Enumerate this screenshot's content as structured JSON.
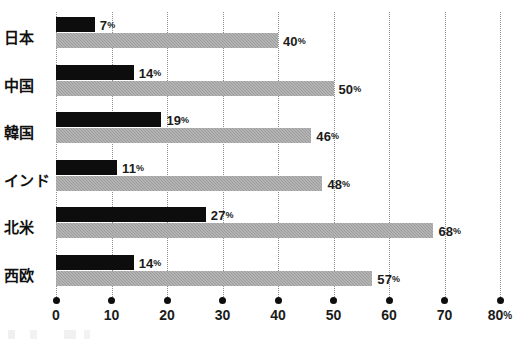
{
  "chart_data": {
    "type": "bar",
    "orientation": "horizontal",
    "title": "",
    "subtitle": "",
    "xlabel": "",
    "ylabel": "",
    "categories": [
      "日本",
      "中国",
      "韓国",
      "インド",
      "北米",
      "西欧"
    ],
    "series": [
      {
        "name": "dark-series",
        "color": "#0d0d0d",
        "values": [
          7,
          14,
          19,
          11,
          27,
          14
        ],
        "labels": [
          "7%",
          "14%",
          "19%",
          "11%",
          "27%",
          "14%"
        ]
      },
      {
        "name": "light-series",
        "color": "#9d9d9d",
        "values": [
          40,
          50,
          46,
          48,
          68,
          57
        ],
        "labels": [
          "40%",
          "50%",
          "46%",
          "48%",
          "68%",
          "57%"
        ]
      }
    ],
    "xlim": [
      0,
      80
    ],
    "xticks": [
      0,
      10,
      20,
      30,
      40,
      50,
      60,
      70,
      80
    ],
    "xtick_labels": [
      "0",
      "10",
      "20",
      "30",
      "40",
      "50",
      "60",
      "70",
      "80%"
    ],
    "grid": true,
    "grid_style": "dotted-vertical",
    "legend": null,
    "legend_position": "none",
    "annotations": [],
    "value_label_suffix": "%"
  },
  "axis": {
    "unit_suffix": "%"
  }
}
